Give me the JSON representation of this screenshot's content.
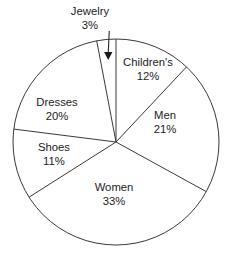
{
  "chart_data": {
    "type": "pie",
    "title": "",
    "subtitle": "",
    "xlabel": "",
    "ylabel": "",
    "legend": "none",
    "grid": false,
    "units": "percent",
    "total": 100,
    "start_angle_deg": 0,
    "direction": "clockwise",
    "categories": [
      "Children's",
      "Men",
      "Women",
      "Shoes",
      "Dresses",
      "Jewelry"
    ],
    "values": [
      12,
      21,
      33,
      11,
      20,
      3
    ],
    "slices": [
      {
        "name": "Children's",
        "label": "Children's",
        "value": 12,
        "value_label": "12%",
        "label_placement": "inside",
        "label_x": 148,
        "label_y": 63,
        "start_deg": 0,
        "end_deg": 43.2
      },
      {
        "name": "Men",
        "label": "Men",
        "value": 21,
        "value_label": "21%",
        "label_placement": "inside",
        "label_y": 116,
        "label_x": 165,
        "start_deg": 43.2,
        "end_deg": 118.8
      },
      {
        "name": "Women",
        "label": "Women",
        "value": 33,
        "value_label": "33%",
        "label_placement": "inside",
        "label_x": 114,
        "label_y": 188,
        "start_deg": 118.8,
        "end_deg": 237.6
      },
      {
        "name": "Shoes",
        "label": "Shoes",
        "value": 11,
        "value_label": "11%",
        "label_placement": "inside",
        "label_x": 54,
        "label_y": 148,
        "start_deg": 237.6,
        "end_deg": 277.2
      },
      {
        "name": "Dresses",
        "label": "Dresses",
        "value": 20,
        "value_label": "20%",
        "label_placement": "inside",
        "label_x": 57,
        "label_y": 103,
        "start_deg": 277.2,
        "end_deg": 349.2
      },
      {
        "name": "Jewelry",
        "label": "Jewelry",
        "value": 3,
        "value_label": "3%",
        "label_placement": "outside-callout",
        "label_x": 90,
        "label_y": 12,
        "start_deg": 349.2,
        "end_deg": 360
      }
    ],
    "geometry": {
      "center_x": 116,
      "center_y": 142,
      "radius": 103
    },
    "colors": {
      "background": "#ffffff",
      "outline": "#3a3a3a",
      "slice_fill": "#ffffff",
      "text": "#1c1c1c",
      "callout": "#1a1a1a"
    }
  }
}
